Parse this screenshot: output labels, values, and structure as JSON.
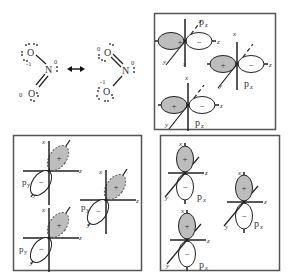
{
  "resonance": {
    "left": {
      "top_oxygen": {
        "atom": "O",
        "formal_charge": "-1"
      },
      "nitrogen": {
        "atom": "N",
        "formal_charge": "0"
      },
      "bottom_oxygen": {
        "atom": "O",
        "formal_charge": "0"
      }
    },
    "arrow": "resonance-arrow",
    "right": {
      "top_oxygen": {
        "atom": "O",
        "formal_charge": "0"
      },
      "nitrogen": {
        "atom": "N",
        "formal_charge": "0"
      },
      "bottom_oxygen": {
        "atom": "O",
        "formal_charge": "-1"
      }
    }
  },
  "panels": {
    "pz": {
      "orbital_label": "p",
      "subscript": "z",
      "axes": {
        "x": "x",
        "y": "y",
        "z": "z"
      },
      "signs": {
        "positive": "+",
        "negative": "−"
      }
    },
    "py": {
      "orbital_label": "p",
      "subscript": "y",
      "axes": {
        "x": "x",
        "y": "y",
        "z": "z"
      },
      "signs": {
        "positive": "+",
        "negative": "−"
      }
    },
    "px": {
      "orbital_label": "p",
      "subscript": "x",
      "axes": {
        "x": "x",
        "y": "y",
        "z": "z"
      },
      "signs": {
        "positive": "+",
        "negative": "−"
      }
    }
  },
  "colors": {
    "shaded_lobe": "#bdbdbd",
    "line": "#222222",
    "frame": "#555555"
  }
}
